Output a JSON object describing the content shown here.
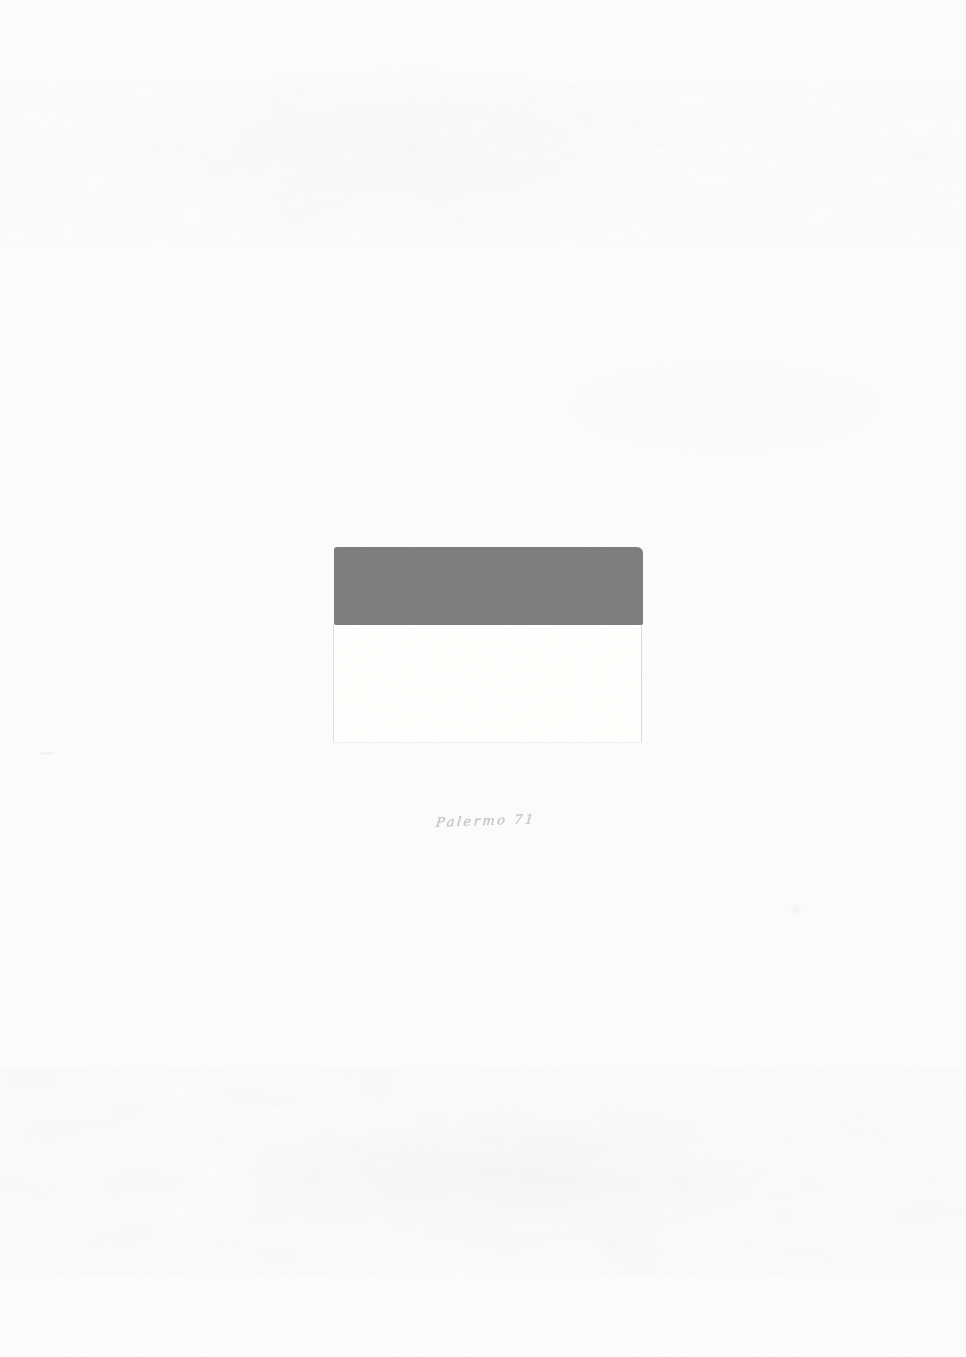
{
  "artwork": {
    "signature_inscription": "Palermo 71",
    "colors": {
      "paper": "#fcfcfc",
      "gray_band": "#7b7b7b",
      "white_panel": "#ffffff",
      "pencil_signature": "#c7c7c7"
    }
  }
}
